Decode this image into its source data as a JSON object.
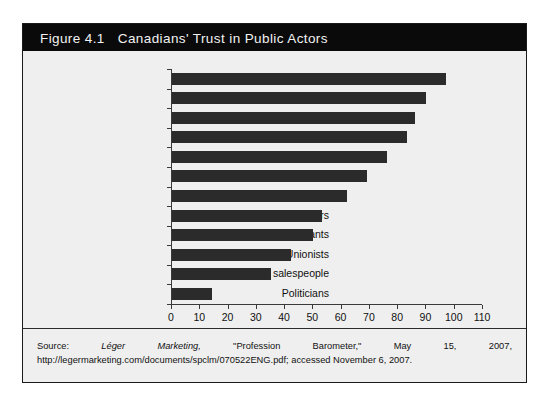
{
  "figure": {
    "number": "Figure 4.1",
    "title": "Canadians' Trust in Public Actors"
  },
  "source": {
    "prefix": "Source:",
    "publisher": "Léger Marketing,",
    "rest": " \"Profession Barometer,\" May 15, 2007, http://legermarketing.com/documents/spclm/070522ENG.pdf; accessed November 6, 2007."
  },
  "chart_data": {
    "type": "bar",
    "orientation": "horizontal",
    "title": "Canadians' Trust in Public Actors",
    "xlabel": "",
    "ylabel": "",
    "xlim": [
      0,
      110
    ],
    "xticks": [
      0,
      10,
      20,
      30,
      40,
      50,
      60,
      70,
      80,
      90,
      100,
      110
    ],
    "grid": false,
    "legend": "none",
    "bar_color": "#2b2b2b",
    "categories": [
      "Firefighters",
      "Teachers",
      "Doctors",
      "Police officers",
      "Judges",
      "Bankers",
      "Church officials",
      "Lawyers",
      "Senior public servants",
      "Unionists",
      "New-car salespeople",
      "Politicians"
    ],
    "values": [
      97,
      90,
      86,
      83,
      76,
      69,
      62,
      53,
      50,
      42,
      35,
      14
    ]
  }
}
